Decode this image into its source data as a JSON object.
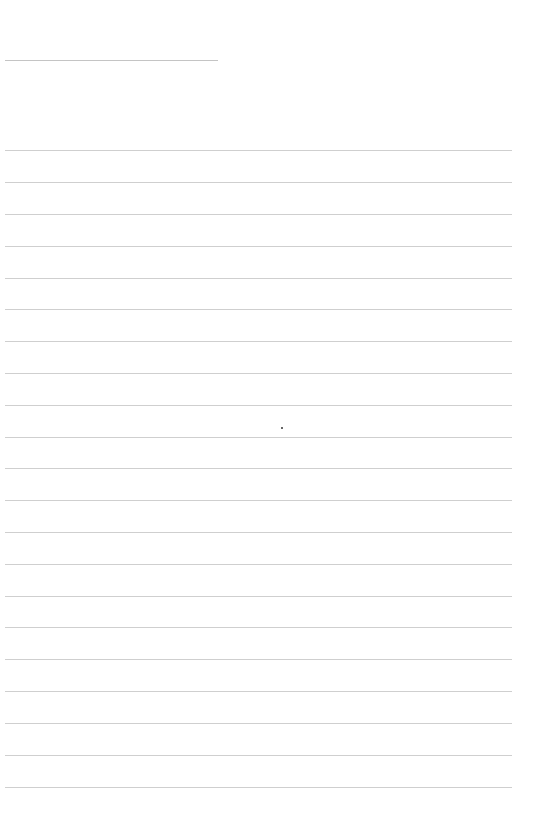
{
  "page": {
    "type": "lined-paper",
    "background": "#ffffff",
    "line_color": "#cfcfcf"
  },
  "header": {
    "faint_text_left": "",
    "faint_text_right": ""
  },
  "title_line": {
    "top": 60,
    "left": 5,
    "width": 213
  },
  "ruled_lines": {
    "left": 5,
    "width": 507,
    "positions": [
      150,
      182,
      214,
      246,
      278,
      309,
      341,
      373,
      405,
      437,
      468,
      500,
      532,
      564,
      596,
      627,
      659,
      691,
      723,
      755,
      787
    ]
  },
  "marks": [
    {
      "x": 281,
      "y": 427
    }
  ]
}
